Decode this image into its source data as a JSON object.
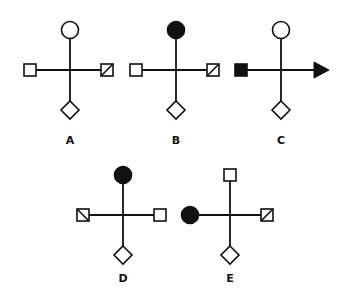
{
  "colors": {
    "stroke": "#111111",
    "fill_dark": "#111111",
    "fill_light": "#ffffff",
    "background": "#ffffff"
  },
  "figures": [
    {
      "label": "A",
      "center": [
        70,
        70
      ],
      "top": "circle-open",
      "left": "square-open",
      "right": "square-diagonal-up",
      "bottom": "diamond-open"
    },
    {
      "label": "B",
      "center": [
        176,
        70
      ],
      "top": "circle-filled",
      "left": "square-open",
      "right": "square-diagonal-up",
      "bottom": "diamond-open"
    },
    {
      "label": "C",
      "center": [
        281,
        70
      ],
      "top": "circle-open",
      "left": "square-filled",
      "right": "arrow-right-filled",
      "bottom": "diamond-open"
    },
    {
      "label": "D",
      "center": [
        123,
        215
      ],
      "top": "circle-filled",
      "left": "square-diagonal-down",
      "right": "square-open",
      "bottom": "diamond-open"
    },
    {
      "label": "E",
      "center": [
        230,
        215
      ],
      "top": "square-open",
      "left": "circle-filled",
      "right": "square-diagonal-up",
      "bottom": "diamond-open"
    }
  ]
}
